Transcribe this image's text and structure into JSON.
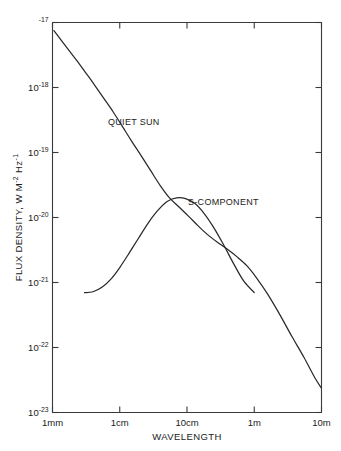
{
  "figure": {
    "background_color": "#ffffff",
    "line_color": "#2a2a2a",
    "axis_color": "#3a3a3a"
  },
  "chart_data": {
    "type": "line",
    "title": "",
    "xlabel": "WAVELENGTH",
    "ylabel": "FLUX DENSITY, W M",
    "ylabel_exp1": "-2",
    "ylabel_mid": " Hz",
    "ylabel_exp2": "-1",
    "xscale": "log",
    "yscale": "log",
    "xlim": [
      0.001,
      10.0
    ],
    "ylim": [
      1e-23,
      1e-17
    ],
    "grid": false,
    "legend": "inline-annotations",
    "x_tick_labels": [
      "1mm",
      "1cm",
      "10cm",
      "1m",
      "10m"
    ],
    "x_tick_values": [
      0.001,
      0.01,
      0.1,
      1.0,
      10.0
    ],
    "y_tick_labels": [
      "-17",
      "-18",
      "-19",
      "-20",
      "-21",
      "-22",
      "-23"
    ],
    "y_tick_mantissa": "10",
    "y_tick_values": [
      1e-17,
      1e-18,
      1e-19,
      1e-20,
      1e-21,
      1e-22,
      1e-23
    ],
    "series": [
      {
        "name": "QUIET SUN",
        "label_x": 0.0042,
        "label_y": 4.2e-19,
        "x": [
          0.00105,
          0.0013,
          0.0017,
          0.0023,
          0.0031,
          0.0042,
          0.0058,
          0.008,
          0.011,
          0.015,
          0.021,
          0.029,
          0.04,
          0.055,
          0.076,
          0.105,
          0.145,
          0.2,
          0.28,
          0.39,
          0.55,
          0.78,
          1.1,
          1.6,
          2.4,
          3.6,
          5.5,
          8.0,
          10.5
        ],
        "y": [
          7.5e-18,
          5.6e-18,
          3.9e-18,
          2.6e-18,
          1.7e-18,
          1.1e-18,
          6.8e-19,
          4.2e-19,
          2.5e-19,
          1.5e-19,
          8.8e-20,
          5.2e-20,
          3.1e-20,
          2e-20,
          1.45e-20,
          1.05e-20,
          7.5e-21,
          5.5e-21,
          4.2e-21,
          3.3e-21,
          2.5e-21,
          1.8e-21,
          1.15e-21,
          6.5e-22,
          3.2e-22,
          1.5e-22,
          7e-23,
          3.4e-23,
          2.2e-23
        ]
      },
      {
        "name": "S-COMPONENT",
        "label_x": 0.145,
        "label_y": 2.6e-20,
        "x": [
          0.003,
          0.004,
          0.0055,
          0.0075,
          0.01,
          0.014,
          0.019,
          0.026,
          0.036,
          0.05,
          0.07,
          0.095,
          0.13,
          0.18,
          0.25,
          0.35,
          0.5,
          0.7,
          1.0
        ],
        "y": [
          7e-22,
          7.2e-22,
          8.5e-22,
          1.15e-21,
          1.7e-21,
          2.9e-21,
          4.8e-21,
          8e-21,
          1.25e-20,
          1.75e-20,
          2e-20,
          1.95e-20,
          1.65e-20,
          1.15e-20,
          7e-21,
          3.8e-21,
          1.9e-21,
          1.05e-21,
          7e-22
        ]
      }
    ],
    "annotations": [
      {
        "text": "QUIET SUN",
        "x_px": 108,
        "y_px": 125
      },
      {
        "text": "S-COMPONENT",
        "x_px": 188,
        "y_px": 205
      }
    ]
  }
}
